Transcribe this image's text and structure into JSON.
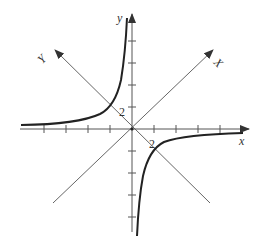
{
  "diagram": {
    "title": "",
    "axes": {
      "x_label": "x",
      "y_label": "y",
      "rotated_x_label": "X",
      "rotated_y_label": "Y"
    },
    "annotations": {
      "label_2_upper": "2",
      "label_2_lower": "2"
    },
    "curve": "hyperbola y = -1/x (branches in quadrants II and IV)",
    "tick_count_per_side": 4,
    "colors": {
      "axis": "#555555",
      "curve": "#222222",
      "diagonal": "#666666"
    }
  }
}
